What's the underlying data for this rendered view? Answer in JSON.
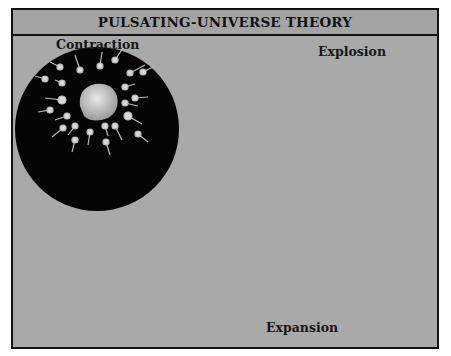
{
  "title": "PULSATING-UNIVERSE THEORY",
  "stages": [
    {
      "name": "Contraction",
      "cx": 97,
      "cy": 129,
      "r": 82,
      "core": "rocky-core"
    },
    {
      "name": "Explosion",
      "cx": 341,
      "cy": 148,
      "r": 70,
      "core": "bright-flash"
    },
    {
      "name": "Expansion",
      "cx": 220,
      "cy": 257,
      "r": 81,
      "core": "dark-center"
    }
  ],
  "arrows": [
    {
      "from": "Contraction",
      "to": "Explosion"
    },
    {
      "from": "Explosion",
      "to": "Expansion"
    },
    {
      "from": "Expansion",
      "to": "Contraction"
    }
  ],
  "colors": {
    "background": "#a9a9a9",
    "circle": "#050505",
    "border": "#111111"
  }
}
